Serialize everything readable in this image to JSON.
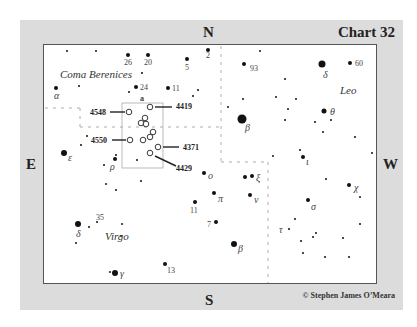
{
  "chart": {
    "title": "Chart 32",
    "credit": "© Stephen James O’Meara",
    "cardinals": {
      "north": "N",
      "south": "S",
      "east": "E",
      "west": "W"
    },
    "constellations": [
      {
        "name": "Coma Berenices",
        "x": 60,
        "y": 78
      },
      {
        "name": "Leo",
        "x": 340,
        "y": 94
      },
      {
        "name": "Virgo",
        "x": 105,
        "y": 240
      }
    ],
    "field_box_label": "a",
    "galaxies": [
      {
        "ngc": "4419",
        "x": 150,
        "y": 107,
        "label_x": 176,
        "label_y": 109,
        "line": [
          155,
          107,
          172,
          107
        ]
      },
      {
        "ngc": "4548",
        "x": 129,
        "y": 112,
        "label_x": 90,
        "label_y": 115,
        "line": [
          110,
          112,
          125,
          112
        ]
      },
      {
        "ngc": "4550",
        "x": 130,
        "y": 140,
        "label_x": 91,
        "label_y": 143,
        "line": [
          112,
          140,
          126,
          140
        ]
      },
      {
        "ngc": "4371",
        "x": 158,
        "y": 147,
        "label_x": 183,
        "label_y": 150,
        "line": [
          163,
          147,
          179,
          147
        ]
      },
      {
        "ngc": "4429",
        "x": 150,
        "y": 153,
        "label_x": 176,
        "label_y": 171,
        "line": [
          155,
          156,
          176,
          166
        ]
      }
    ],
    "unlabeled_galaxies": [
      {
        "x": 145,
        "y": 118
      },
      {
        "x": 141,
        "y": 123
      },
      {
        "x": 146,
        "y": 124
      },
      {
        "x": 153,
        "y": 132
      },
      {
        "x": 150,
        "y": 137
      },
      {
        "x": 143,
        "y": 140
      }
    ],
    "stars": [
      {
        "x": 67,
        "y": 51,
        "r": 1
      },
      {
        "x": 96,
        "y": 51,
        "r": 1
      },
      {
        "x": 128,
        "y": 55,
        "r": 2,
        "label": "26",
        "lx": 124,
        "ly": 65,
        "type": "num"
      },
      {
        "x": 148,
        "y": 55,
        "r": 2,
        "label": "20",
        "lx": 144,
        "ly": 65,
        "type": "num"
      },
      {
        "x": 187,
        "y": 59,
        "r": 2,
        "label": "5",
        "lx": 185,
        "ly": 70,
        "type": "num"
      },
      {
        "x": 208,
        "y": 50,
        "r": 2,
        "label": "2",
        "lx": 206,
        "ly": 58,
        "type": "num"
      },
      {
        "x": 142,
        "y": 73,
        "r": 1
      },
      {
        "x": 136,
        "y": 87,
        "r": 2,
        "label": "24",
        "lx": 140,
        "ly": 90,
        "type": "num"
      },
      {
        "x": 168,
        "y": 88,
        "r": 2,
        "label": "11",
        "lx": 172,
        "ly": 91,
        "type": "num"
      },
      {
        "x": 56,
        "y": 88,
        "r": 2,
        "label": "α",
        "lx": 54,
        "ly": 99,
        "type": "greek"
      },
      {
        "x": 79,
        "y": 86,
        "r": 1
      },
      {
        "x": 129,
        "y": 92,
        "r": 1
      },
      {
        "x": 193,
        "y": 96,
        "r": 1
      },
      {
        "x": 260,
        "y": 51,
        "r": 1
      },
      {
        "x": 244,
        "y": 64,
        "r": 2,
        "label": "93",
        "lx": 250,
        "ly": 71,
        "type": "num"
      },
      {
        "x": 322,
        "y": 64,
        "r": 3.5,
        "label": "δ",
        "lx": 323,
        "ly": 78,
        "type": "greek"
      },
      {
        "x": 350,
        "y": 63,
        "r": 2,
        "label": "60",
        "lx": 355,
        "ly": 66,
        "type": "num"
      },
      {
        "x": 285,
        "y": 79,
        "r": 1
      },
      {
        "x": 276,
        "y": 97,
        "r": 1
      },
      {
        "x": 243,
        "y": 99,
        "r": 1
      },
      {
        "x": 296,
        "y": 99,
        "r": 1
      },
      {
        "x": 228,
        "y": 107,
        "r": 1
      },
      {
        "x": 288,
        "y": 109,
        "r": 1
      },
      {
        "x": 324,
        "y": 111,
        "r": 2.5,
        "label": "θ",
        "lx": 330,
        "ly": 115,
        "type": "greek"
      },
      {
        "x": 315,
        "y": 122,
        "r": 1
      },
      {
        "x": 331,
        "y": 120,
        "r": 1
      },
      {
        "x": 285,
        "y": 120,
        "r": 1
      },
      {
        "x": 242,
        "y": 119,
        "r": 4.5,
        "label": "β",
        "lx": 245,
        "ly": 131,
        "type": "greek"
      },
      {
        "x": 323,
        "y": 132,
        "r": 1
      },
      {
        "x": 355,
        "y": 137,
        "r": 1
      },
      {
        "x": 198,
        "y": 90,
        "r": 1
      },
      {
        "x": 273,
        "y": 156,
        "r": 1
      },
      {
        "x": 87,
        "y": 136,
        "r": 1
      },
      {
        "x": 81,
        "y": 145,
        "r": 1
      },
      {
        "x": 64,
        "y": 153,
        "r": 3,
        "label": "ε",
        "lx": 68,
        "ly": 161,
        "type": "greek"
      },
      {
        "x": 116,
        "y": 155,
        "r": 1
      },
      {
        "x": 115,
        "y": 159,
        "r": 2,
        "label": "ρ",
        "lx": 110,
        "ly": 170,
        "type": "greek"
      },
      {
        "x": 104,
        "y": 165,
        "r": 1
      },
      {
        "x": 137,
        "y": 160,
        "r": 1
      },
      {
        "x": 106,
        "y": 184,
        "r": 1
      },
      {
        "x": 116,
        "y": 190,
        "r": 1
      },
      {
        "x": 141,
        "y": 181,
        "r": 1
      },
      {
        "x": 204,
        "y": 173,
        "r": 2,
        "label": "o",
        "lx": 208,
        "ly": 179,
        "type": "greek"
      },
      {
        "x": 245,
        "y": 177,
        "r": 2
      },
      {
        "x": 252,
        "y": 176,
        "r": 2,
        "label": "ξ",
        "lx": 256,
        "ly": 181,
        "type": "greek"
      },
      {
        "x": 214,
        "y": 193,
        "r": 2,
        "label": "π",
        "lx": 218,
        "ly": 202,
        "type": "greek"
      },
      {
        "x": 250,
        "y": 195,
        "r": 2,
        "label": "ν",
        "lx": 254,
        "ly": 203,
        "type": "greek"
      },
      {
        "x": 195,
        "y": 202,
        "r": 2,
        "label": "11",
        "lx": 190,
        "ly": 213,
        "type": "num"
      },
      {
        "x": 216,
        "y": 222,
        "r": 2,
        "label": "7",
        "lx": 207,
        "ly": 227,
        "type": "num"
      },
      {
        "x": 234,
        "y": 244,
        "r": 3,
        "label": "β",
        "lx": 238,
        "ly": 252,
        "type": "greek"
      },
      {
        "x": 300,
        "y": 150,
        "r": 1
      },
      {
        "x": 303,
        "y": 157,
        "r": 2,
        "label": "ι",
        "lx": 306,
        "ly": 165,
        "type": "greek"
      },
      {
        "x": 372,
        "y": 153,
        "r": 1
      },
      {
        "x": 326,
        "y": 179,
        "r": 1
      },
      {
        "x": 349,
        "y": 185,
        "r": 2,
        "label": "χ",
        "lx": 354,
        "ly": 191,
        "type": "greek"
      },
      {
        "x": 360,
        "y": 197,
        "r": 1
      },
      {
        "x": 308,
        "y": 200,
        "r": 2,
        "label": "σ",
        "lx": 311,
        "ly": 210,
        "type": "greek"
      },
      {
        "x": 295,
        "y": 219,
        "r": 1
      },
      {
        "x": 289,
        "y": 229,
        "r": 1,
        "label": "τ",
        "lx": 279,
        "ly": 233,
        "type": "greek"
      },
      {
        "x": 316,
        "y": 233,
        "r": 1
      },
      {
        "x": 313,
        "y": 237,
        "r": 1
      },
      {
        "x": 343,
        "y": 238,
        "r": 1
      },
      {
        "x": 301,
        "y": 241,
        "r": 1
      },
      {
        "x": 360,
        "y": 224,
        "r": 1
      },
      {
        "x": 303,
        "y": 253,
        "r": 1
      },
      {
        "x": 325,
        "y": 257,
        "r": 1
      },
      {
        "x": 349,
        "y": 257,
        "r": 1
      },
      {
        "x": 78,
        "y": 224,
        "r": 3,
        "label": "δ",
        "lx": 76,
        "ly": 237,
        "type": "greek"
      },
      {
        "x": 89,
        "y": 227,
        "r": 1
      },
      {
        "x": 97,
        "y": 222,
        "r": 1,
        "label": "35",
        "lx": 96,
        "ly": 220,
        "type": "num"
      },
      {
        "x": 122,
        "y": 224,
        "r": 1
      },
      {
        "x": 121,
        "y": 236,
        "r": 1
      },
      {
        "x": 76,
        "y": 243,
        "r": 1
      },
      {
        "x": 165,
        "y": 264,
        "r": 2,
        "label": "13",
        "lx": 167,
        "ly": 273,
        "type": "num"
      },
      {
        "x": 110,
        "y": 272,
        "r": 1
      },
      {
        "x": 115,
        "y": 273,
        "r": 3,
        "label": "γ",
        "lx": 120,
        "ly": 277,
        "type": "greek"
      }
    ]
  }
}
